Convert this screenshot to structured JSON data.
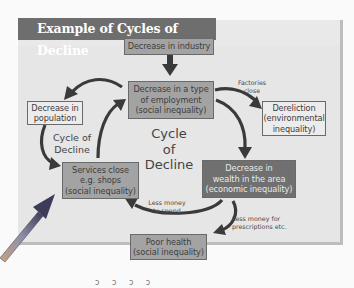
{
  "title": "Example of Cycles of Decline",
  "center_label": [
    "Cycle",
    "of",
    "Decline"
  ],
  "side_label": [
    "Cycle of",
    "Decline"
  ],
  "nodes": {
    "industry": {
      "lines": [
        "Decrease in industry"
      ],
      "fill": "mid"
    },
    "employment": {
      "lines": [
        "Decrease in a type",
        "of employment",
        "(social inequality)"
      ],
      "fill": "mid"
    },
    "dereliction": {
      "lines": [
        "Dereliction",
        "(environmental",
        "inequality)"
      ],
      "fill": "light"
    },
    "population": {
      "lines": [
        "Decrease in",
        "population"
      ],
      "fill": "light"
    },
    "services": {
      "lines": [
        "Services close",
        "e.g. shops",
        "(social inequality)"
      ],
      "fill": "mid"
    },
    "wealth": {
      "lines": [
        "Decrease in",
        "wealth in the area",
        "(economic inequality)"
      ],
      "fill": "dark"
    },
    "health": {
      "lines": [
        "Poor health",
        "(social inequality)"
      ],
      "fill": "mid"
    }
  },
  "edge_labels": {
    "factories_close": [
      "Factories",
      "close"
    ],
    "less_money_spend": [
      "Less money",
      "to spend"
    ],
    "less_money_prescriptions": [
      "Less money for",
      "prescriptions etc."
    ]
  },
  "footer_scribble": "ↄ ɔ ɔ ↄ",
  "colors": {
    "title_bar": "#6e6e6e",
    "panel": "#e6e6e6",
    "box_mid": "#a3a3a3",
    "box_dark": "#707070",
    "box_light": "#ececec",
    "arrow": "#3a3a3a"
  }
}
